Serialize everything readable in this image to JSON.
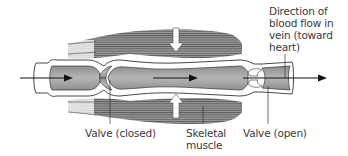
{
  "diagram": {
    "labels": {
      "direction": [
        "Direction of",
        "blood flow in",
        "vein (toward",
        "heart)"
      ],
      "valve_closed": "Valve (closed)",
      "skeletal_muscle": [
        "Skeletal",
        "muscle"
      ],
      "valve_open": "Valve (open)"
    },
    "colors": {
      "muscle": "#8a8a8a",
      "muscle_stripe": "#5e5e5e",
      "blood": "#a9a9a9",
      "vein_wall": "#ffffff",
      "outline": "#333333",
      "arrow": "#111111",
      "label_text": "#3a3a3a"
    }
  }
}
